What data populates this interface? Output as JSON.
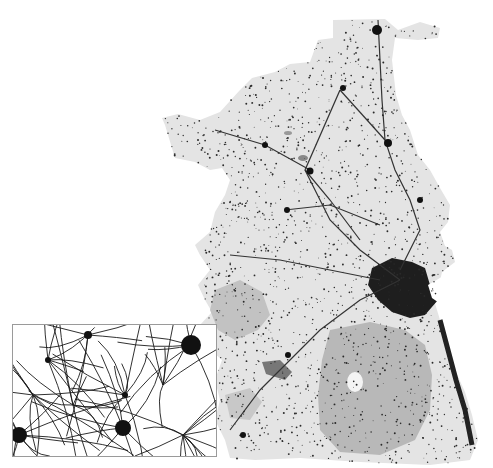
{
  "map": {
    "description": "Settlement and road density map of a coastal region with an enlarged detail inset",
    "legend": [],
    "colors": {
      "background": "#ffffff",
      "land": "#e4e4e4",
      "upland": "#b4b4b4",
      "lake_dark": "#7a7a7a",
      "settlement": "#1a1a1a",
      "inset_border": "#9a9a9a"
    },
    "layers": [
      "land",
      "uplands",
      "roads",
      "settlements",
      "urban-core",
      "inset"
    ],
    "inset": {
      "label": "detail-view",
      "content": "road network and settlement clusters"
    }
  }
}
